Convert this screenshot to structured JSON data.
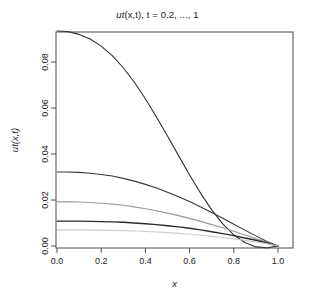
{
  "chart_data": {
    "type": "line",
    "title": "ut(x,t), t = 0.2, ..., 1",
    "title_main": "ut",
    "title_paren": "(x,t)",
    "title_rest": ", t = 0.2, ..., 1",
    "xlabel": "x",
    "ylabel": "ut(x,t)",
    "xlim": [
      0.0,
      1.0
    ],
    "ylim": [
      0.0,
      0.1
    ],
    "xticks": [
      "0.0",
      "0.2",
      "0.4",
      "0.6",
      "0.8",
      "1.0"
    ],
    "xtick_values": [
      0.0,
      0.2,
      0.4,
      0.6,
      0.8,
      1.0
    ],
    "yticks": [
      "0.00",
      "0.02",
      "0.04",
      "0.06",
      "0.08"
    ],
    "ytick_values": [
      0.0,
      0.02,
      0.04,
      0.06,
      0.08
    ],
    "grid": false,
    "legend": "none",
    "x": [
      0.0,
      0.05,
      0.1,
      0.15,
      0.2,
      0.25,
      0.3,
      0.35,
      0.4,
      0.45,
      0.5,
      0.55,
      0.6,
      0.65,
      0.7,
      0.75,
      0.8,
      0.85,
      0.9,
      0.95,
      1.0
    ],
    "series": [
      {
        "name": "t = 0.2",
        "color": "#303030",
        "width": 1.1,
        "values": [
          0.0935,
          0.0932,
          0.092,
          0.09,
          0.0869,
          0.0828,
          0.0775,
          0.0712,
          0.064,
          0.0561,
          0.0478,
          0.0393,
          0.0309,
          0.0229,
          0.0157,
          0.0096,
          0.0048,
          0.0015,
          -0.0004,
          -0.0008,
          0.0
        ]
      },
      {
        "name": "t = 0.4",
        "color": "#383838",
        "width": 1.1,
        "values": [
          0.0322,
          0.0322,
          0.032,
          0.0316,
          0.0311,
          0.0304,
          0.0294,
          0.0282,
          0.0268,
          0.0252,
          0.0234,
          0.0214,
          0.0193,
          0.017,
          0.0146,
          0.0121,
          0.0095,
          0.0069,
          0.0044,
          0.002,
          0.0
        ]
      },
      {
        "name": "t = 0.6",
        "color": "#999999",
        "width": 1.1,
        "values": [
          0.0192,
          0.0192,
          0.0191,
          0.0189,
          0.0186,
          0.0182,
          0.0177,
          0.017,
          0.0162,
          0.0153,
          0.0143,
          0.0132,
          0.012,
          0.0107,
          0.0093,
          0.0079,
          0.0064,
          0.0048,
          0.0032,
          0.0016,
          0.0
        ]
      },
      {
        "name": "t = 0.8",
        "color": "#2b2b2b",
        "width": 1.4,
        "values": [
          0.0108,
          0.0108,
          0.0108,
          0.0107,
          0.0106,
          0.0105,
          0.0103,
          0.01,
          0.0097,
          0.0093,
          0.0088,
          0.0083,
          0.0077,
          0.007,
          0.0062,
          0.0054,
          0.0045,
          0.0035,
          0.0025,
          0.0013,
          0.0
        ]
      },
      {
        "name": "t = 1",
        "color": "#cccccc",
        "width": 1.1,
        "values": [
          0.007,
          0.007,
          0.007,
          0.0069,
          0.0069,
          0.0068,
          0.0067,
          0.0065,
          0.0063,
          0.0061,
          0.0058,
          0.0055,
          0.0051,
          0.0047,
          0.0042,
          0.0037,
          0.0031,
          0.0025,
          0.0018,
          0.001,
          0.0
        ]
      }
    ]
  },
  "geometry": {
    "plot_left": 56,
    "plot_right": 293,
    "plot_top": 32,
    "plot_bottom": 248
  }
}
